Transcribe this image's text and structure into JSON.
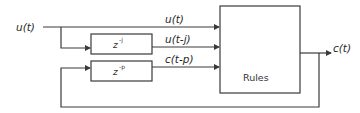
{
  "diagram": {
    "input_label": "u(t)",
    "output_label": "c(t)",
    "signals": [
      {
        "label": "u(t)"
      },
      {
        "label": "u(t-j)"
      },
      {
        "label": "c(t-p)"
      }
    ],
    "blocks": {
      "delay_j": {
        "base": "z",
        "exponent": "-j"
      },
      "delay_p": {
        "base": "z",
        "exponent": "-p"
      },
      "rules": {
        "label": "Rules"
      }
    },
    "colors": {
      "line": "#3a3a3a",
      "text": "#2a2a2a",
      "background": "#ffffff"
    }
  }
}
